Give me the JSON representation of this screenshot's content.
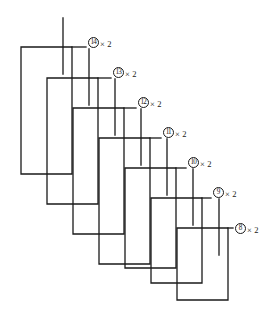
{
  "figure": {
    "type": "rebar-staple-schedule",
    "line_color": "#1a1a1a",
    "background_color": "#ffffff",
    "stroke_width": 1.3,
    "tick_stroke_width": 1.3,
    "multiplier_symbol": "×",
    "quantity_each": "2",
    "bars": [
      {
        "mark": "14",
        "quantity_text": "× 2",
        "label_x": 88,
        "label_y": 42,
        "staple": {
          "left_x": 21,
          "right_x": 72,
          "top_y": 47,
          "bottom_y": 174
        },
        "tick": {
          "x": 63,
          "y_top": 18,
          "y_bottom": 74
        }
      },
      {
        "mark": "13",
        "quantity_text": "× 2",
        "label_x": 113,
        "label_y": 72,
        "staple": {
          "left_x": 47,
          "right_x": 98,
          "top_y": 78,
          "bottom_y": 204
        },
        "tick": {
          "x": 89,
          "y_top": 49,
          "y_bottom": 105
        }
      },
      {
        "mark": "12",
        "quantity_text": "× 2",
        "label_x": 138,
        "label_y": 102,
        "staple": {
          "left_x": 73,
          "right_x": 124,
          "top_y": 108,
          "bottom_y": 234
        },
        "tick": {
          "x": 115,
          "y_top": 79,
          "y_bottom": 135
        }
      },
      {
        "mark": "11",
        "quantity_text": "× 2",
        "label_x": 163,
        "label_y": 132,
        "staple": {
          "left_x": 99,
          "right_x": 150,
          "top_y": 138,
          "bottom_y": 264
        },
        "tick": {
          "x": 141,
          "y_top": 109,
          "y_bottom": 165
        }
      },
      {
        "mark": "10",
        "quantity_text": "× 2",
        "label_x": 188,
        "label_y": 162,
        "staple": {
          "left_x": 125,
          "right_x": 176,
          "top_y": 168,
          "bottom_y": 268
        },
        "tick": {
          "x": 167,
          "y_top": 139,
          "y_bottom": 195
        }
      },
      {
        "mark": "9",
        "quantity_text": "× 2",
        "label_x": 213,
        "label_y": 192,
        "staple": {
          "left_x": 151,
          "right_x": 202,
          "top_y": 198,
          "bottom_y": 283
        },
        "tick": {
          "x": 193,
          "y_top": 169,
          "y_bottom": 225
        }
      },
      {
        "mark": "8",
        "quantity_text": "× 2",
        "label_x": 235,
        "label_y": 228,
        "staple": {
          "left_x": 177,
          "right_x": 228,
          "top_y": 228,
          "bottom_y": 300
        },
        "tick": {
          "x": 219,
          "y_top": 199,
          "y_bottom": 255
        }
      }
    ],
    "leader_lines": [
      {
        "from_x": 72,
        "to_x": 86,
        "y": 47
      },
      {
        "from_x": 98,
        "to_x": 111,
        "y": 78
      },
      {
        "from_x": 124,
        "to_x": 136,
        "y": 108
      },
      {
        "from_x": 150,
        "to_x": 161,
        "y": 138
      },
      {
        "from_x": 176,
        "to_x": 186,
        "y": 168
      },
      {
        "from_x": 202,
        "to_x": 211,
        "y": 198
      },
      {
        "from_x": 228,
        "to_x": 233,
        "y": 228
      }
    ]
  }
}
